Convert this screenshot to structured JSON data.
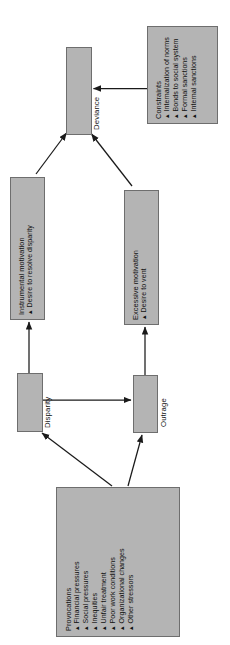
{
  "figure": {
    "type": "flowchart",
    "orientation": "rotated-90-counterclockwise",
    "colors": {
      "box_fill": "#b4b4b4",
      "box_border": "#6e6e6e",
      "arrow": "#1a1a1a",
      "background": "#ffffff",
      "text": "#111111"
    }
  },
  "nodes": {
    "deviance": {
      "label": "Deviance"
    },
    "constraints": {
      "title": "Constraints",
      "items": [
        "Internalization of norms",
        "Bonds to social system",
        "Formal sanctions",
        "Internal sanctions"
      ]
    },
    "instrumental_motivation": {
      "title": "Instrumental motivation",
      "items": [
        "Desire to resolve disparity"
      ]
    },
    "excessive_motivation": {
      "title": "Excessive motivation",
      "items": [
        "Desire to vent"
      ]
    },
    "disparity": {
      "label": "Disparity"
    },
    "outrage": {
      "label": "Outrage"
    },
    "provocations": {
      "title": "Provocations",
      "items": [
        "Financial pressures",
        "Social pressures",
        "Inequities",
        "Unfair treatment",
        "Poor work conditions",
        "Organizational changes",
        "Other stressors"
      ]
    }
  },
  "bullet_glyph": "▲",
  "edges": [
    {
      "from": "instrumental_motivation",
      "to": "deviance"
    },
    {
      "from": "excessive_motivation",
      "to": "deviance"
    },
    {
      "from": "constraints",
      "to": "deviance"
    },
    {
      "from": "disparity",
      "to": "instrumental_motivation"
    },
    {
      "from": "outrage",
      "to": "excessive_motivation"
    },
    {
      "from": "disparity",
      "to": "outrage"
    },
    {
      "from": "provocations",
      "to": "disparity"
    },
    {
      "from": "provocations",
      "to": "outrage"
    }
  ]
}
